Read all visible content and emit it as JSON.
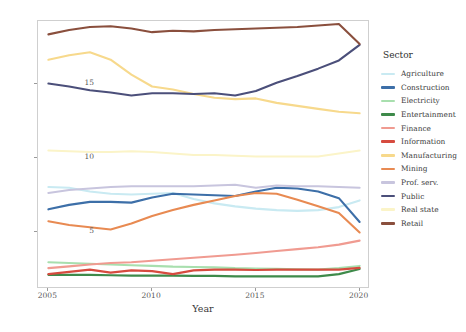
{
  "chart_data": {
    "type": "line",
    "title": "",
    "xlabel": "Year",
    "ylabel": "Participation",
    "xlim": [
      2004.5,
      2020.5
    ],
    "ylim": [
      1.2,
      19.2
    ],
    "xticks": [
      2005,
      2010,
      2015,
      2020
    ],
    "yticks": [
      5,
      10,
      15
    ],
    "grid": false,
    "legend_title": "Sector",
    "legend_position": "right",
    "x": [
      2005,
      2006,
      2007,
      2008,
      2009,
      2010,
      2011,
      2012,
      2013,
      2014,
      2015,
      2016,
      2017,
      2018,
      2019,
      2020
    ],
    "series": [
      {
        "name": "Agriculture",
        "color": "#c9eaf2",
        "values": [
          8.05,
          8.0,
          7.75,
          7.6,
          7.55,
          7.6,
          7.65,
          7.25,
          6.95,
          6.75,
          6.6,
          6.5,
          6.45,
          6.5,
          6.7,
          7.15
        ]
      },
      {
        "name": "Construction",
        "color": "#3d6fa8",
        "values": [
          6.55,
          6.85,
          7.05,
          7.05,
          7.0,
          7.35,
          7.6,
          7.55,
          7.5,
          7.45,
          7.75,
          8.0,
          7.95,
          7.75,
          7.3,
          5.7
        ]
      },
      {
        "name": "Electricity",
        "color": "#a8dfae",
        "values": [
          3.0,
          2.95,
          2.9,
          2.85,
          2.8,
          2.75,
          2.7,
          2.68,
          2.65,
          2.6,
          2.58,
          2.55,
          2.52,
          2.5,
          2.6,
          2.75
        ]
      },
      {
        "name": "Entertainment",
        "color": "#3e8a4a",
        "values": [
          2.15,
          2.15,
          2.15,
          2.12,
          2.1,
          2.1,
          2.1,
          2.08,
          2.08,
          2.05,
          2.05,
          2.05,
          2.05,
          2.05,
          2.2,
          2.55
        ]
      },
      {
        "name": "Finance",
        "color": "#f09b91",
        "values": [
          2.6,
          2.72,
          2.85,
          2.95,
          3.0,
          3.1,
          3.2,
          3.3,
          3.4,
          3.5,
          3.62,
          3.75,
          3.88,
          4.0,
          4.18,
          4.45
        ]
      },
      {
        "name": "Information",
        "color": "#d64b3f",
        "values": [
          2.2,
          2.35,
          2.5,
          2.3,
          2.45,
          2.4,
          2.2,
          2.45,
          2.5,
          2.5,
          2.48,
          2.5,
          2.5,
          2.5,
          2.5,
          2.62
        ]
      },
      {
        "name": "Manufacturing",
        "color": "#f7d98c",
        "values": [
          16.6,
          16.9,
          17.1,
          16.6,
          15.6,
          14.8,
          14.6,
          14.3,
          14.05,
          13.95,
          14.0,
          13.7,
          13.5,
          13.3,
          13.1,
          13.0
        ]
      },
      {
        "name": "Mining",
        "color": "#e88a52",
        "values": [
          5.75,
          5.5,
          5.35,
          5.2,
          5.6,
          6.1,
          6.5,
          6.85,
          7.15,
          7.45,
          7.65,
          7.6,
          7.2,
          6.75,
          6.3,
          5.0
        ]
      },
      {
        "name": "Prof. serv.",
        "color": "#c8c5de",
        "values": [
          7.65,
          7.85,
          7.95,
          8.05,
          8.1,
          8.1,
          8.1,
          8.1,
          8.15,
          8.2,
          8.0,
          8.15,
          8.1,
          8.1,
          8.05,
          8.0
        ]
      },
      {
        "name": "Public",
        "color": "#4b4f7a",
        "values": [
          15.0,
          14.8,
          14.55,
          14.4,
          14.2,
          14.35,
          14.35,
          14.3,
          14.35,
          14.2,
          14.5,
          15.05,
          15.5,
          16.0,
          16.55,
          17.6
        ]
      },
      {
        "name": "Real state",
        "color": "#fbf4c8",
        "values": [
          10.5,
          10.45,
          10.4,
          10.4,
          10.45,
          10.4,
          10.3,
          10.2,
          10.2,
          10.15,
          10.1,
          10.1,
          10.1,
          10.1,
          10.3,
          10.5
        ]
      },
      {
        "name": "Retail",
        "color": "#8a4f3d",
        "values": [
          18.3,
          18.6,
          18.8,
          18.85,
          18.7,
          18.45,
          18.55,
          18.5,
          18.6,
          18.65,
          18.7,
          18.75,
          18.8,
          18.9,
          19.0,
          17.65
        ]
      }
    ]
  },
  "axes": {
    "xlabel": "Year",
    "ylabel": "Participation",
    "xtick_labels": [
      "2005",
      "2010",
      "2015",
      "2020"
    ],
    "ytick_labels": [
      "5",
      "10",
      "15"
    ]
  },
  "legend": {
    "title": "Sector",
    "entries": [
      {
        "label": "Agriculture",
        "color": "#c9eaf2"
      },
      {
        "label": "Construction",
        "color": "#3d6fa8"
      },
      {
        "label": "Electricity",
        "color": "#a8dfae"
      },
      {
        "label": "Entertainment",
        "color": "#3e8a4a"
      },
      {
        "label": "Finance",
        "color": "#f09b91"
      },
      {
        "label": "Information",
        "color": "#d64b3f"
      },
      {
        "label": "Manufacturing",
        "color": "#f7d98c"
      },
      {
        "label": "Mining",
        "color": "#e88a52"
      },
      {
        "label": "Prof. serv.",
        "color": "#c8c5de"
      },
      {
        "label": "Public",
        "color": "#4b4f7a"
      },
      {
        "label": "Real state",
        "color": "#fbf4c8"
      },
      {
        "label": "Retail",
        "color": "#8a4f3d"
      }
    ]
  }
}
